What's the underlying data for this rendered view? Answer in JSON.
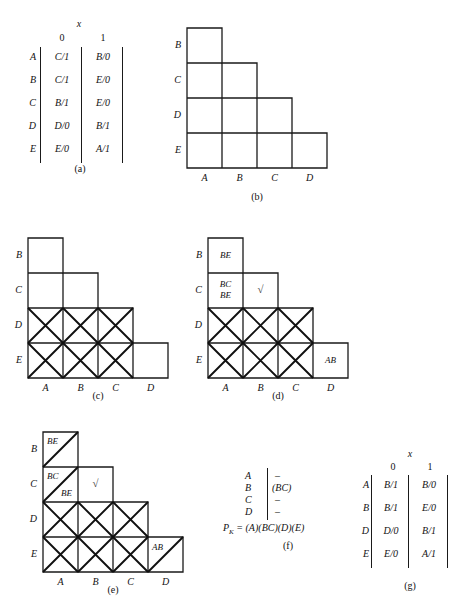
{
  "figure": {
    "panels": [
      "(a)",
      "(b)",
      "(c)",
      "(d)",
      "(e)",
      "(f)",
      "(g)"
    ]
  },
  "state_table_a": {
    "caption": "(a)",
    "input_label": "x",
    "column_headers": [
      "0",
      "1"
    ],
    "row_labels": [
      "A",
      "B",
      "C",
      "D",
      "E"
    ],
    "rows": [
      {
        "state": "A",
        "next_0": "C/1",
        "next_1": "B/0"
      },
      {
        "state": "B",
        "next_0": "C/1",
        "next_1": "E/0"
      },
      {
        "state": "C",
        "next_0": "B/1",
        "next_1": "E/0"
      },
      {
        "state": "D",
        "next_0": "D/0",
        "next_1": "B/1"
      },
      {
        "state": "E",
        "next_0": "E/0",
        "next_1": "A/1"
      }
    ]
  },
  "state_table_g": {
    "caption": "(g)",
    "input_label": "x",
    "column_headers": [
      "0",
      "1"
    ],
    "row_labels": [
      "A",
      "B",
      "D",
      "E"
    ],
    "rows": [
      {
        "state": "A",
        "next_0": "B/1",
        "next_1": "B/0"
      },
      {
        "state": "B",
        "next_0": "B/1",
        "next_1": "E/0"
      },
      {
        "state": "D",
        "next_0": "D/0",
        "next_1": "B/1"
      },
      {
        "state": "E",
        "next_0": "E/0",
        "next_1": "A/1"
      }
    ]
  },
  "chart_b": {
    "caption": "(b)",
    "row_labels": [
      "B",
      "C",
      "D",
      "E"
    ],
    "col_labels": [
      "A",
      "B",
      "C",
      "D"
    ],
    "cells": []
  },
  "chart_c": {
    "caption": "(c)",
    "row_labels": [
      "B",
      "C",
      "D",
      "E"
    ],
    "col_labels": [
      "A",
      "B",
      "C",
      "D"
    ],
    "crossed": [
      {
        "row": "D",
        "col": "A"
      },
      {
        "row": "D",
        "col": "B"
      },
      {
        "row": "D",
        "col": "C"
      },
      {
        "row": "E",
        "col": "A"
      },
      {
        "row": "E",
        "col": "B"
      },
      {
        "row": "E",
        "col": "C"
      }
    ],
    "notes": []
  },
  "chart_d": {
    "caption": "(d)",
    "row_labels": [
      "B",
      "C",
      "D",
      "E"
    ],
    "col_labels": [
      "A",
      "B",
      "C",
      "D"
    ],
    "crossed": [
      {
        "row": "D",
        "col": "A"
      },
      {
        "row": "D",
        "col": "B"
      },
      {
        "row": "D",
        "col": "C"
      },
      {
        "row": "E",
        "col": "A"
      },
      {
        "row": "E",
        "col": "B"
      },
      {
        "row": "E",
        "col": "C"
      }
    ],
    "notes": [
      {
        "row": "B",
        "col": "A",
        "text": "BE"
      },
      {
        "row": "C",
        "col": "A",
        "text_top": "BC",
        "text_bottom": "BE"
      },
      {
        "row": "C",
        "col": "B",
        "text": "√"
      },
      {
        "row": "E",
        "col": "D",
        "text": "AB"
      }
    ]
  },
  "chart_e": {
    "caption": "(e)",
    "row_labels": [
      "B",
      "C",
      "D",
      "E"
    ],
    "col_labels": [
      "A",
      "B",
      "C",
      "D"
    ],
    "crossed": [
      {
        "row": "D",
        "col": "A"
      },
      {
        "row": "D",
        "col": "B"
      },
      {
        "row": "D",
        "col": "C"
      },
      {
        "row": "E",
        "col": "A"
      },
      {
        "row": "E",
        "col": "B"
      },
      {
        "row": "E",
        "col": "C"
      }
    ],
    "slashed": [
      {
        "row": "B",
        "col": "A"
      },
      {
        "row": "C",
        "col": "A"
      },
      {
        "row": "E",
        "col": "D"
      }
    ],
    "notes": [
      {
        "row": "B",
        "col": "A",
        "text": "BE"
      },
      {
        "row": "C",
        "col": "A",
        "text_top": "BC",
        "text_bottom": "BE"
      },
      {
        "row": "C",
        "col": "B",
        "text": "√"
      },
      {
        "row": "E",
        "col": "D",
        "text": "AB"
      }
    ]
  },
  "partition_f": {
    "caption": "(f)",
    "rows": [
      {
        "state": "A",
        "implied": "–"
      },
      {
        "state": "B",
        "implied": "(BC)"
      },
      {
        "state": "C",
        "implied": "–"
      },
      {
        "state": "D",
        "implied": "–"
      }
    ],
    "result_label": "P",
    "result_sub": "K",
    "result_value": " = (A)(BC)(D)(E)"
  }
}
